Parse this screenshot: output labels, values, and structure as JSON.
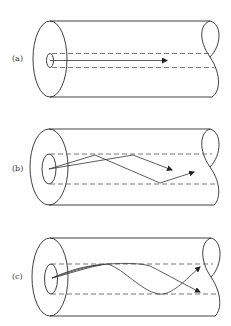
{
  "figure": {
    "panels": [
      {
        "id": "a",
        "label": "(a)",
        "description": "single-mode fiber: straight axial ray"
      },
      {
        "id": "b",
        "label": "(b)",
        "description": "multimode step-index fiber: zigzag rays"
      },
      {
        "id": "c",
        "label": "(c)",
        "description": "multimode graded-index fiber: curved rays"
      }
    ]
  },
  "colors": {
    "line": "#2a2a2a",
    "dash": "#555555",
    "background": "#ffffff"
  }
}
